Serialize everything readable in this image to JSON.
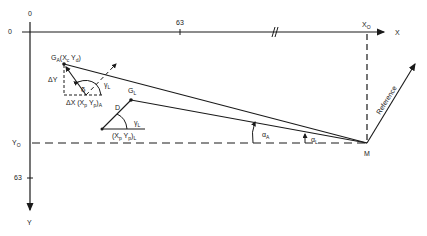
{
  "diagram": {
    "axes": {
      "origin_x_label": "0",
      "origin_y_label": "0",
      "x_axis_label": "X",
      "y_axis_label": "Y",
      "x_tick_label": "63",
      "y_tick_label": "63",
      "x_break_mark": "//",
      "x0_label": "X",
      "x0_sub": "O",
      "y0_label": "Y",
      "y0_sub": "O"
    },
    "points": {
      "ga_label": "G",
      "ga_sub": "A",
      "ga_coords": "(X",
      "ga_coords_sub1": "c",
      "ga_coords_mid": " Y",
      "ga_coords_sub2": "d",
      "ga_coords_end": ")",
      "gl_label": "G",
      "gl_sub": "L",
      "d_label": "D",
      "m_label": "M"
    },
    "annotations": {
      "delta_y": "ΔY",
      "delta_x": "ΔX (X",
      "delta_x_sub1": "p",
      "delta_x_mid": " Y",
      "delta_x_sub2": "p",
      "delta_x_end": ")",
      "delta_x_sub3": "A",
      "delta_angle": "δ",
      "gamma_l_upper": "γ",
      "gamma_l_upper_sub": "L",
      "gamma_l_lower": "γ",
      "gamma_l_lower_sub": "L",
      "xp_yp_l": "(X",
      "xp_yp_l_sub1": "p",
      "xp_yp_l_mid": " Y",
      "xp_yp_l_sub2": "p",
      "xp_yp_l_end": ")",
      "xp_yp_l_sub3": "L",
      "alpha_a": "α",
      "alpha_a_sub": "A",
      "alpha_l": "α",
      "alpha_l_sub": "L",
      "reference": "Reference"
    },
    "colors": {
      "ink": "#1a1a1a",
      "background": "#ffffff"
    }
  }
}
